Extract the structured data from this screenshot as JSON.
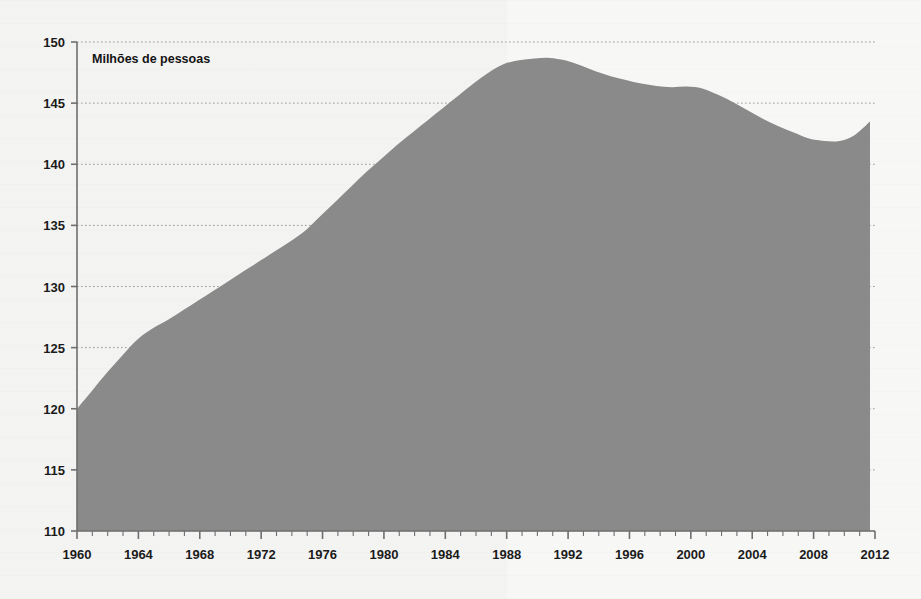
{
  "figure": {
    "title_inside": "Milhões de pessoas",
    "background_color": "#f7f7f6",
    "area_fill_color": "#8a8a8a",
    "axis_color": "#6f6f6f",
    "grid_color": "#9a9a9a",
    "text_color": "#1b1b1b"
  },
  "chart_data": {
    "type": "area",
    "title": "Milhões de pessoas",
    "xlabel": "",
    "ylabel": "",
    "units": "Milhões de pessoas",
    "xlim": [
      1960,
      2012
    ],
    "ylim": [
      110,
      150
    ],
    "yticks": [
      110,
      115,
      120,
      125,
      130,
      135,
      140,
      145,
      150
    ],
    "xticks": [
      1960,
      1964,
      1968,
      1972,
      1976,
      1980,
      1984,
      1988,
      1992,
      1996,
      2000,
      2004,
      2008,
      2012
    ],
    "xtick_minor_step": 1,
    "grid": "horizontal-dotted",
    "legend": "none",
    "x": [
      1960,
      1961,
      1962,
      1963,
      1964,
      1965,
      1966,
      1967,
      1968,
      1969,
      1970,
      1971,
      1972,
      1973,
      1974,
      1975,
      1976,
      1977,
      1978,
      1979,
      1980,
      1981,
      1982,
      1983,
      1984,
      1985,
      1986,
      1987,
      1988,
      1989,
      1990,
      1991,
      1992,
      1993,
      1994,
      1995,
      1996,
      1997,
      1998,
      1999,
      2000,
      2001,
      2002,
      2003,
      2004,
      2005,
      2006,
      2007,
      2008,
      2009,
      2010,
      2011,
      2012
    ],
    "values": [
      120.0,
      121.5,
      123.0,
      124.4,
      125.7,
      126.6,
      127.3,
      128.1,
      128.9,
      129.7,
      130.5,
      131.3,
      132.1,
      132.9,
      133.7,
      134.6,
      135.8,
      137.0,
      138.2,
      139.4,
      140.5,
      141.6,
      142.6,
      143.6,
      144.6,
      145.6,
      146.6,
      147.5,
      148.2,
      148.5,
      148.65,
      148.7,
      148.5,
      148.1,
      147.6,
      147.2,
      146.9,
      146.6,
      146.4,
      146.3,
      146.35,
      146.2,
      145.7,
      145.1,
      144.4,
      143.7,
      143.1,
      142.6,
      142.1,
      141.9,
      141.9,
      142.4,
      143.5
    ],
    "annotations": {
      "peak": {
        "year": 1991,
        "value": 148.7
      },
      "start": {
        "year": 1960,
        "value": 120.0
      },
      "trough": {
        "year": 2009,
        "value": 141.9
      },
      "end": {
        "year": 2012,
        "value": 143.5
      }
    }
  },
  "axes": {
    "y_tick_labels": [
      "150",
      "145",
      "140",
      "135",
      "130",
      "125",
      "120",
      "115",
      "110"
    ],
    "x_tick_labels": [
      "1960",
      "1964",
      "1968",
      "1972",
      "1976",
      "1980",
      "1984",
      "1988",
      "1992",
      "1996",
      "2000",
      "2004",
      "2008",
      "2012"
    ]
  }
}
